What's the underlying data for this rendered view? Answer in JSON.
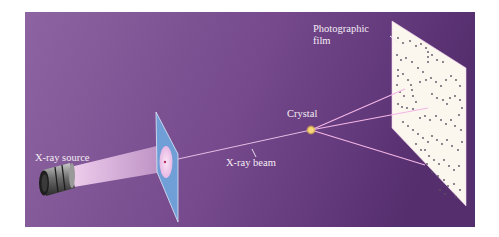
{
  "figure": {
    "background_colors": {
      "left": "#8c62a0",
      "right": "#573070"
    },
    "labels": {
      "xray_source": "X-ray source",
      "xray_beam": "X-ray beam",
      "crystal": "Crystal",
      "film_line1": "Photographic",
      "film_line2": "film"
    },
    "colors": {
      "screen": "#6f9fd6",
      "film": "#fbf6ee",
      "beam": "#f2b8e6",
      "crystal": "#e8c35a",
      "spots": "#5b5060"
    }
  }
}
